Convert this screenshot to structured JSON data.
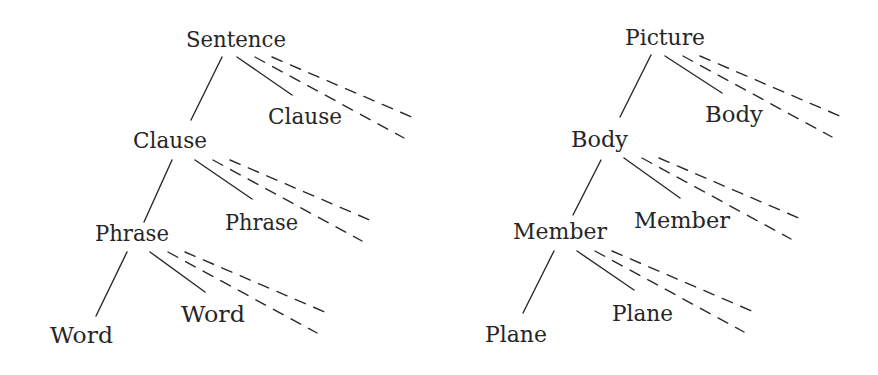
{
  "diagram": {
    "colors": {
      "background": "#ffffff",
      "ink": "#262626"
    },
    "trees": [
      {
        "id": "left-tree",
        "nodes": [
          {
            "id": "sentence",
            "label": "Sentence",
            "x": 186,
            "baseline": 47,
            "width": 100
          },
          {
            "id": "clause-a",
            "label": "Clause",
            "x": 133,
            "baseline": 148,
            "width": 74
          },
          {
            "id": "clause-b",
            "label": "Clause",
            "x": 268,
            "baseline": 124,
            "width": 74
          },
          {
            "id": "phrase-a",
            "label": "Phrase",
            "x": 95,
            "baseline": 241,
            "width": 74
          },
          {
            "id": "phrase-b",
            "label": "Phrase",
            "x": 225,
            "baseline": 230,
            "width": 73
          },
          {
            "id": "word-a",
            "label": "Word",
            "x": 50,
            "baseline": 343,
            "width": 63
          },
          {
            "id": "word-b",
            "label": "Word",
            "x": 181,
            "baseline": 322,
            "width": 64
          }
        ],
        "branches": [
          {
            "from": "sentence",
            "left": [
              222,
              57,
              191,
              120
            ],
            "solid": [
              237,
              57,
              292,
              95
            ]
          },
          {
            "from": "clause-a",
            "left": [
              172,
              160,
              144,
              222
            ],
            "solid": [
              195,
              160,
              252,
              199
            ]
          },
          {
            "from": "phrase-a",
            "left": [
              127,
              252,
              96,
              316
            ],
            "solid": [
              150,
              252,
              205,
              292
            ]
          }
        ]
      },
      {
        "id": "right-tree",
        "nodes": [
          {
            "id": "picture",
            "label": "Picture",
            "x": 625,
            "baseline": 45,
            "width": 80
          },
          {
            "id": "body-a",
            "label": "Body",
            "x": 571,
            "baseline": 147,
            "width": 57
          },
          {
            "id": "body-b",
            "label": "Body",
            "x": 705,
            "baseline": 122,
            "width": 58
          },
          {
            "id": "member-a",
            "label": "Member",
            "x": 513,
            "baseline": 239,
            "width": 94
          },
          {
            "id": "member-b",
            "label": "Member",
            "x": 634,
            "baseline": 228,
            "width": 96
          },
          {
            "id": "plane-a",
            "label": "Plane",
            "x": 485,
            "baseline": 342,
            "width": 62
          },
          {
            "id": "plane-b",
            "label": "Plane",
            "x": 612,
            "baseline": 321,
            "width": 61
          }
        ],
        "branches": [
          {
            "from": "picture",
            "left": [
              651,
              55,
              620,
              117
            ],
            "solid": [
              665,
              56,
              722,
              93
            ]
          },
          {
            "from": "body-a",
            "left": [
              601,
              160,
              573,
              215
            ],
            "solid": [
              624,
              158,
              680,
              198
            ]
          },
          {
            "from": "member-a",
            "left": [
              554,
              251,
              523,
              313
            ],
            "solid": [
              577,
              251,
              634,
              290
            ]
          }
        ]
      }
    ],
    "dashed_pattern": {
      "steep": {
        "start_dx": 18,
        "end_dx": 167,
        "end_dy": 81
      },
      "shallow": {
        "start_dx": 35,
        "end_dx": 177,
        "end_dy": 61
      }
    }
  }
}
